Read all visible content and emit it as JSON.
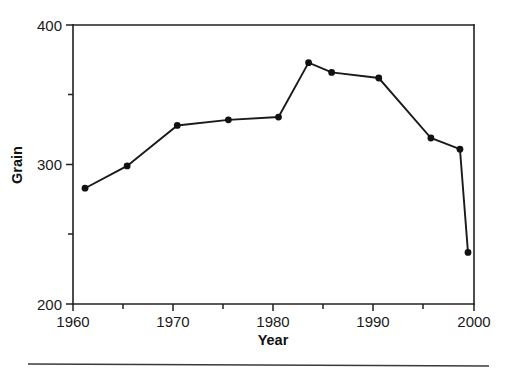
{
  "chart_data": {
    "type": "line",
    "title": "",
    "xlabel": "Year",
    "ylabel": "Grain",
    "xlim": [
      1960,
      2000
    ],
    "ylim": [
      200,
      400
    ],
    "grid": false,
    "legend": null,
    "x_major_ticks": [
      1960,
      1970,
      1980,
      1990,
      2000
    ],
    "x_major_tick_labels": [
      "1960",
      "1970",
      "1980",
      "1990",
      "2000"
    ],
    "x_minor_ticks": [
      1965,
      1975,
      1985,
      1995
    ],
    "y_major_ticks": [
      200,
      300,
      400
    ],
    "y_major_tick_labels": [
      "200",
      "300",
      "400"
    ],
    "y_minor_ticks": [
      250,
      350
    ],
    "marker": "filled-circle",
    "series": [
      {
        "name": "Grain",
        "x": [
          1961.2,
          1965.4,
          1970.4,
          1975.5,
          1980.5,
          1983.5,
          1985.8,
          1990.5,
          1995.7,
          1998.6,
          1999.4
        ],
        "values": [
          283,
          299,
          328,
          332,
          334,
          373,
          366,
          362,
          319,
          311,
          237
        ]
      }
    ]
  },
  "axes": {
    "y_title": "Grain",
    "x_title": "Year",
    "y_tick_top": "400",
    "y_tick_mid": "300",
    "y_tick_bottom": "200",
    "x_tick_1": "1960",
    "x_tick_2": "1970",
    "x_tick_3": "1980",
    "x_tick_4": "1990",
    "x_tick_5": "2000"
  }
}
